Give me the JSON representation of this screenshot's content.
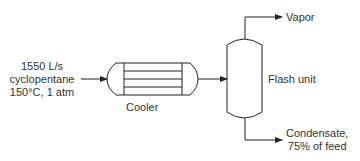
{
  "diagram": {
    "feed": {
      "lines": [
        "1550 L/s",
        "cyclopentane",
        "150°C, 1 atm"
      ]
    },
    "units": {
      "cooler": {
        "label": "Cooler",
        "type": "shell-and-tube heat exchanger"
      },
      "flash": {
        "label": "Flash unit",
        "type": "vertical vessel"
      }
    },
    "outlets": {
      "vapor": {
        "label": "Vapor"
      },
      "condensate": {
        "lines": [
          "Condensate,",
          "75% of feed"
        ]
      }
    },
    "colors": {
      "stroke": "#222222",
      "text": "#333333",
      "background": "#ffffff"
    }
  }
}
